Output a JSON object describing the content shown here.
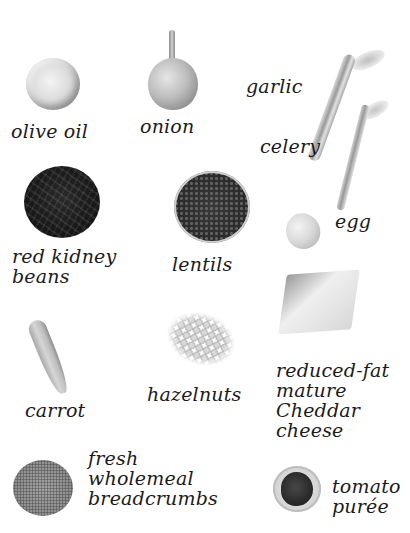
{
  "page": {
    "ingredients": [
      {
        "id": "olive-oil",
        "label_lines": [
          "olive oil"
        ],
        "icon": "olive-oil-dish-icon"
      },
      {
        "id": "onion",
        "label_lines": [
          "onion"
        ],
        "icon": "onion-icon"
      },
      {
        "id": "garlic",
        "label_lines": [
          "garlic"
        ],
        "icon": null
      },
      {
        "id": "celery",
        "label_lines": [
          "celery"
        ],
        "icon": "celery-icon"
      },
      {
        "id": "red-kidney-beans",
        "label_lines": [
          "red kidney",
          "beans"
        ],
        "icon": "kidney-beans-bowl-icon"
      },
      {
        "id": "lentils",
        "label_lines": [
          "lentils"
        ],
        "icon": "lentils-bowl-icon"
      },
      {
        "id": "egg",
        "label_lines": [
          "egg"
        ],
        "icon": "egg-icon"
      },
      {
        "id": "carrot",
        "label_lines": [
          "carrot"
        ],
        "icon": "carrot-icon"
      },
      {
        "id": "hazelnuts",
        "label_lines": [
          "hazelnuts"
        ],
        "icon": "hazelnuts-icon"
      },
      {
        "id": "cheddar",
        "label_lines": [
          "reduced-fat",
          "mature",
          "Cheddar",
          "cheese"
        ],
        "icon": "cheese-block-icon"
      },
      {
        "id": "breadcrumbs",
        "label_lines": [
          "fresh",
          "wholemeal",
          "breadcrumbs"
        ],
        "icon": "breadcrumbs-bowl-icon"
      },
      {
        "id": "tomato-puree",
        "label_lines": [
          "tomato",
          "purée"
        ],
        "icon": "tomato-puree-dish-icon"
      }
    ]
  },
  "colors": {
    "background": "#ffffff",
    "text": "#1b1b1b"
  }
}
